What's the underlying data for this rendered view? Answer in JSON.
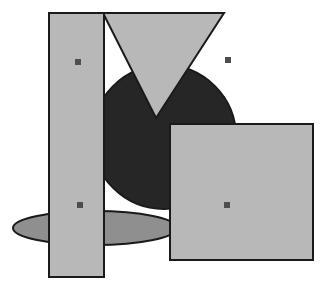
{
  "canvas": {
    "width": 328,
    "height": 293,
    "background_color": "#ffffff",
    "outline_color": "#1a1a1a",
    "outline_width": 2
  },
  "palette": {
    "light_gray_fill": "#b8b8b8",
    "mid_gray_fill": "#8f8f8f",
    "dark_fill": "#262626",
    "outline": "#1a1a1a",
    "marker_fill": "#4d4d4d",
    "white": "#ffffff"
  },
  "shapes": [
    {
      "id": "ellipse-shadow",
      "name": "ellipse",
      "fill": "#8f8f8f",
      "cx": 95,
      "cy": 228,
      "rx": 82,
      "ry": 17,
      "z": 1
    },
    {
      "id": "circle-dark",
      "name": "circle",
      "fill": "#262626",
      "cx": 164,
      "cy": 137,
      "r": 72,
      "z": 2
    },
    {
      "id": "triangle-down",
      "name": "triangle",
      "fill": "#b8b8b8",
      "points": "103,13 224,13 156,118",
      "z": 3
    },
    {
      "id": "rect-tall",
      "name": "tall-rectangle",
      "fill": "#b8b8b8",
      "x": 49,
      "y": 13,
      "width": 55,
      "height": 264,
      "z": 4
    },
    {
      "id": "rect-square",
      "name": "square",
      "fill": "#b8b8b8",
      "x": 170,
      "y": 124,
      "width": 143,
      "height": 136,
      "z": 5
    }
  ],
  "markers": [
    {
      "id": "marker-1",
      "name": "marker-top-left",
      "cx": 78,
      "cy": 62,
      "size": 6,
      "fill": "#4d4d4d"
    },
    {
      "id": "marker-2",
      "name": "marker-top-right",
      "cx": 228,
      "cy": 60,
      "size": 6,
      "fill": "#4d4d4d"
    },
    {
      "id": "marker-3",
      "name": "marker-bottom-left",
      "cx": 80,
      "cy": 205,
      "size": 6,
      "fill": "#4d4d4d"
    },
    {
      "id": "marker-4",
      "name": "marker-bottom-right",
      "cx": 227,
      "cy": 205,
      "size": 6,
      "fill": "#4d4d4d"
    }
  ]
}
